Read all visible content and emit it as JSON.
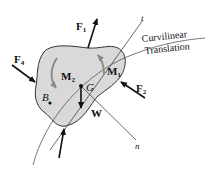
{
  "diagram": {
    "colors": {
      "body_fill": "#d9d9d9",
      "body_stroke": "#333333",
      "line": "#444444",
      "arrow": "#111111",
      "moment_arrow": "#8a8a8a",
      "background": "#ffffff"
    },
    "labels": {
      "F1": "F",
      "F1_sub": "1",
      "F2": "F",
      "F2_sub": "2",
      "F4": "F",
      "F4_sub": "4",
      "M1": "M",
      "M1_sub": "1",
      "M2": "M",
      "M2_sub": "2",
      "G": "G",
      "B": "B",
      "W": "W",
      "t": "t",
      "n": "n",
      "path_line1": "Curvilinear",
      "path_line2": "Translation"
    },
    "nodes": [
      {
        "id": "G",
        "desc": "center of mass"
      },
      {
        "id": "B",
        "desc": "arbitrary point"
      }
    ],
    "edges": [
      {
        "id": "F1",
        "type": "force"
      },
      {
        "id": "F2",
        "type": "force"
      },
      {
        "id": "F4",
        "type": "force"
      },
      {
        "id": "F3",
        "type": "force (unlabeled, bottom)"
      },
      {
        "id": "W",
        "type": "weight"
      },
      {
        "id": "M1",
        "type": "couple moment"
      },
      {
        "id": "M2",
        "type": "couple moment"
      },
      {
        "id": "t",
        "type": "tangential axis"
      },
      {
        "id": "n",
        "type": "normal axis"
      }
    ]
  }
}
